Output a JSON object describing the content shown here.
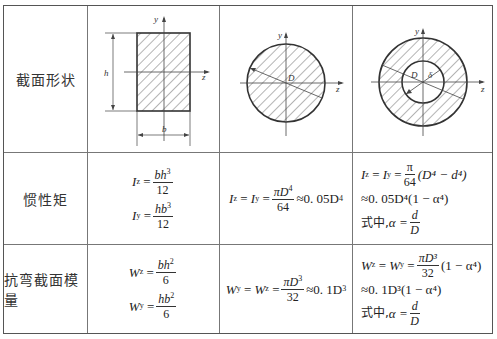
{
  "table": {
    "rows": [
      {
        "label": "截面形状"
      },
      {
        "label": "惯性矩"
      },
      {
        "label": "抗弯截面模量"
      }
    ],
    "shapes": {
      "rectangle": {
        "axis_y": "y",
        "axis_z": "z",
        "dim_h": "h",
        "dim_b": "b"
      },
      "solid_circle": {
        "axis_y": "y",
        "axis_z": "z",
        "dim_D": "D"
      },
      "hollow_circle": {
        "axis_y": "y",
        "axis_z": "z",
        "dim_D": "D",
        "dim_d": "δ"
      }
    },
    "inertia": {
      "rectangle": {
        "Iz": {
          "lhs": "I",
          "sub": "z",
          "num": "bh",
          "num_exp": "3",
          "den": "12"
        },
        "Iy": {
          "lhs": "I",
          "sub": "y",
          "num": "hb",
          "num_exp": "3",
          "den": "12"
        }
      },
      "solid_circle": {
        "lhs": "I",
        "sub1": "z",
        "sub2": "y",
        "num": "πD",
        "num_exp": "4",
        "den": "64",
        "approx": "≈0. 05D",
        "approx_exp": "4"
      },
      "hollow_circle": {
        "line1_num": "π",
        "line1_den": "64",
        "line1_paren": "(D⁴ − d⁴)",
        "line2": "≈0. 05D⁴(1 − α⁴)",
        "where": "式中,",
        "alpha": "α =",
        "alpha_num": "d",
        "alpha_den": "D"
      }
    },
    "modulus": {
      "rectangle": {
        "Wz": {
          "lhs": "W",
          "sub": "z",
          "num": "bh",
          "num_exp": "2",
          "den": "6"
        },
        "Wy": {
          "lhs": "W",
          "sub": "y",
          "num": "hb",
          "num_exp": "2",
          "den": "6"
        }
      },
      "solid_circle": {
        "lhs": "W",
        "sub1": "y",
        "sub2": "z",
        "num": "πD",
        "num_exp": "3",
        "den": "32",
        "approx": "≈0. 1D",
        "approx_exp": "3"
      },
      "hollow_circle": {
        "line1_num": "πD³",
        "line1_den": "32",
        "line1_paren": "(1 − α⁴)",
        "line2": "≈0. 1D³(1 − α⁴)",
        "where": "式中,",
        "alpha": "α =",
        "alpha_num": "d",
        "alpha_den": "D"
      }
    }
  }
}
